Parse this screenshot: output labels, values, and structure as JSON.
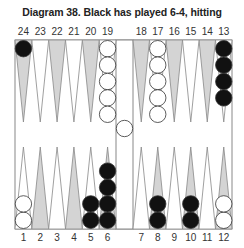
{
  "title": "Diagram 38.  Black has played 6-4, hitting",
  "colors": {
    "shaded_point": "#d4d4d4",
    "white_point": "#ffffff",
    "outline": "#888888",
    "black_checker": "#111111",
    "white_checker": "#ffffff"
  },
  "top_labels": [
    "24",
    "23",
    "22",
    "21",
    "20",
    "19",
    "18",
    "17",
    "16",
    "15",
    "14",
    "13"
  ],
  "bottom_labels": [
    "1",
    "2",
    "3",
    "4",
    "5",
    "6",
    "7",
    "8",
    "9",
    "10",
    "11",
    "12"
  ],
  "points": {
    "24": {
      "shade": "gray",
      "checkers": [
        {
          "color": "black",
          "count": 1
        }
      ]
    },
    "23": {
      "shade": "white",
      "checkers": []
    },
    "22": {
      "shade": "gray",
      "checkers": []
    },
    "21": {
      "shade": "white",
      "checkers": []
    },
    "20": {
      "shade": "gray",
      "checkers": []
    },
    "19": {
      "shade": "white",
      "checkers": [
        {
          "color": "white",
          "count": 5
        }
      ]
    },
    "18": {
      "shade": "gray",
      "checkers": []
    },
    "17": {
      "shade": "white",
      "checkers": [
        {
          "color": "white",
          "count": 5
        }
      ]
    },
    "16": {
      "shade": "gray",
      "checkers": []
    },
    "15": {
      "shade": "white",
      "checkers": []
    },
    "14": {
      "shade": "gray",
      "checkers": []
    },
    "13": {
      "shade": "white",
      "checkers": [
        {
          "color": "black",
          "count": 4
        }
      ]
    },
    "1": {
      "shade": "white",
      "checkers": [
        {
          "color": "white",
          "count": 2
        }
      ]
    },
    "2": {
      "shade": "gray",
      "checkers": []
    },
    "3": {
      "shade": "white",
      "checkers": []
    },
    "4": {
      "shade": "gray",
      "checkers": []
    },
    "5": {
      "shade": "white",
      "checkers": [
        {
          "color": "black",
          "count": 2
        }
      ]
    },
    "6": {
      "shade": "gray",
      "checkers": [
        {
          "color": "black",
          "count": 4
        }
      ]
    },
    "7": {
      "shade": "white",
      "checkers": []
    },
    "8": {
      "shade": "gray",
      "checkers": [
        {
          "color": "black",
          "count": 2
        }
      ]
    },
    "9": {
      "shade": "white",
      "checkers": []
    },
    "10": {
      "shade": "gray",
      "checkers": [
        {
          "color": "black",
          "count": 2
        }
      ]
    },
    "11": {
      "shade": "white",
      "checkers": []
    },
    "12": {
      "shade": "gray",
      "checkers": [
        {
          "color": "white",
          "count": 2
        }
      ]
    }
  },
  "bar": {
    "checkers": [
      {
        "color": "white",
        "count": 1
      }
    ]
  }
}
